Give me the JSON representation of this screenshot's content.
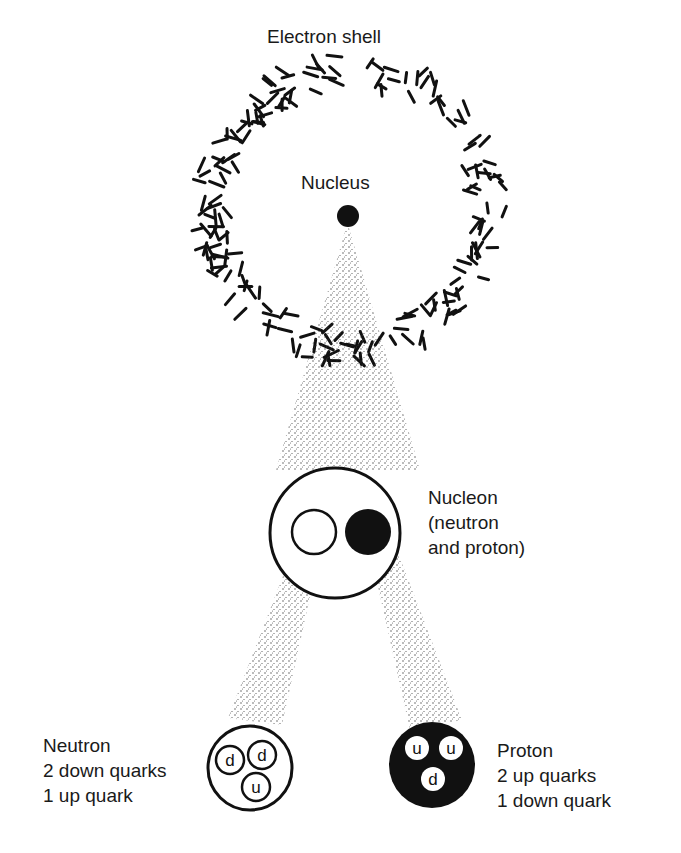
{
  "diagram": {
    "title_labels": {
      "electron_shell": "Electron shell",
      "nucleus": "Nucleus"
    },
    "nucleon": {
      "line1": "Nucleon",
      "line2": "(neutron",
      "line3": "and proton)"
    },
    "neutron": {
      "line1": "Neutron",
      "line2": "2 down quarks",
      "line3": "1 up quark",
      "quarks": [
        "d",
        "d",
        "u"
      ]
    },
    "proton": {
      "line1": "Proton",
      "line2": "2 up quarks",
      "line3": "1 down quark",
      "quarks": [
        "u",
        "u",
        "d"
      ]
    },
    "colors": {
      "ink": "#111111",
      "background": "#ffffff"
    }
  }
}
